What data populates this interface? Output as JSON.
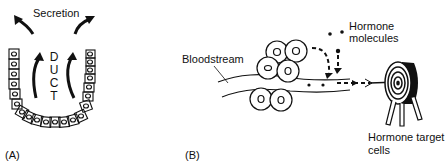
{
  "panel_a": {
    "label": "(A)",
    "secretion_label": "Secretion",
    "duct_letters": [
      "D",
      "U",
      "C",
      "T"
    ]
  },
  "panel_b": {
    "label": "(B)",
    "bloodstream_label": "Bloodstream",
    "hormone_molecules_label_line1": "Hormone",
    "hormone_molecules_label_line2": "molecules",
    "target_label_line1": "Hormone target",
    "target_label_line2": "cells"
  },
  "colors": {
    "ink": "#111111",
    "background": "#ffffff"
  }
}
